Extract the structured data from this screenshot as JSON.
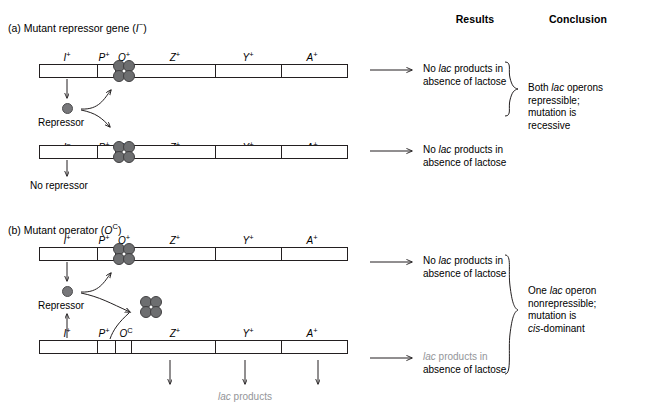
{
  "headers": {
    "results": "Results",
    "conclusion": "Conclusion"
  },
  "panels": [
    {
      "id": "a",
      "label": "(a) Mutant repressor gene (",
      "gene_symbol": "I",
      "gene_sup": "−",
      "label_close": ")",
      "operons": [
        {
          "id": "a1",
          "loci": [
            {
              "symbol": "I",
              "sup": "+"
            },
            {
              "symbol": "P",
              "sup": "+"
            },
            {
              "symbol": "O",
              "sup": "+"
            },
            {
              "symbol": "Z",
              "sup": "+"
            },
            {
              "symbol": "Y",
              "sup": "+"
            },
            {
              "symbol": "A",
              "sup": "+"
            }
          ],
          "repressor_bound": true,
          "under_label": "Repressor",
          "result": {
            "line1_pre": "No ",
            "line1_em": "lac",
            "line1_post": " products in",
            "line2": "absence of lactose",
            "gray": false
          }
        },
        {
          "id": "a2",
          "loci": [
            {
              "symbol": "I",
              "sup": "−"
            },
            {
              "symbol": "P",
              "sup": "+"
            },
            {
              "symbol": "O",
              "sup": "+"
            },
            {
              "symbol": "Z",
              "sup": "+"
            },
            {
              "symbol": "Y",
              "sup": "+"
            },
            {
              "symbol": "A",
              "sup": "+"
            }
          ],
          "repressor_bound": true,
          "under_label": "No repressor",
          "result": {
            "line1_pre": "No ",
            "line1_em": "lac",
            "line1_post": " products in",
            "line2": "absence of lactose",
            "gray": false
          }
        }
      ],
      "conclusion": {
        "line1_pre": "Both ",
        "line1_em": "lac",
        "line1_post": " operons",
        "line2": "repressible;",
        "line3": "mutation is",
        "line4_em": "",
        "line4": "recessive"
      }
    },
    {
      "id": "b",
      "label": "(b) Mutant operator (",
      "gene_symbol": "O",
      "gene_sup": "C",
      "label_close": ")",
      "operons": [
        {
          "id": "b1",
          "loci": [
            {
              "symbol": "I",
              "sup": "+"
            },
            {
              "symbol": "P",
              "sup": "+"
            },
            {
              "symbol": "O",
              "sup": "+"
            },
            {
              "symbol": "Z",
              "sup": "+"
            },
            {
              "symbol": "Y",
              "sup": "+"
            },
            {
              "symbol": "A",
              "sup": "+"
            }
          ],
          "repressor_bound": true,
          "under_label": "Repressor",
          "result": {
            "line1_pre": "No ",
            "line1_em": "lac",
            "line1_post": " products in",
            "line2": "absence of lactose",
            "gray": false
          }
        },
        {
          "id": "b2",
          "loci": [
            {
              "symbol": "I",
              "sup": "+"
            },
            {
              "symbol": "P",
              "sup": "+"
            },
            {
              "symbol": "O",
              "sup": "C"
            },
            {
              "symbol": "Z",
              "sup": "+"
            },
            {
              "symbol": "Y",
              "sup": "+"
            },
            {
              "symbol": "A",
              "sup": "+"
            }
          ],
          "repressor_bound": false,
          "under_label": "",
          "result": {
            "line1_pre": "",
            "line1_em": "lac",
            "line1_post": " products in",
            "line2": "absence of lactose",
            "gray": true
          }
        }
      ],
      "conclusion": {
        "line1_pre": "One ",
        "line1_em": "lac",
        "line1_post": " operon",
        "line2": "nonrepressible;",
        "line3": "mutation is",
        "line4_em": "cis",
        "line4": "-dominant"
      },
      "products_label_em": "lac",
      "products_label": " products"
    }
  ]
}
